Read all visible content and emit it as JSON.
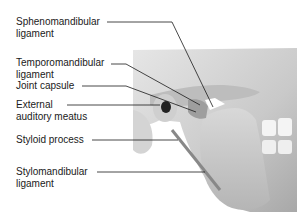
{
  "diagram": {
    "labels": [
      {
        "id": "sphenomandibular",
        "line1": "Sphenomandibular",
        "line2": "ligament"
      },
      {
        "id": "temporomandibular",
        "line1": "Temporomandibular",
        "line2": "ligament"
      },
      {
        "id": "joint-capsule",
        "line1": "Joint capsule",
        "line2": ""
      },
      {
        "id": "external-auditory-meatus",
        "line1": "External",
        "line2": "auditory meatus"
      },
      {
        "id": "styloid-process",
        "line1": "Styloid process",
        "line2": ""
      },
      {
        "id": "stylomandibular",
        "line1": "Stylomandibular",
        "line2": "ligament"
      }
    ]
  }
}
